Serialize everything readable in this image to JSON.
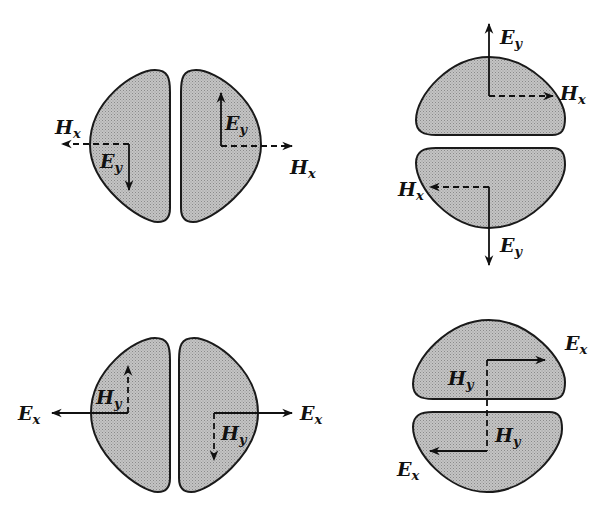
{
  "diagram": {
    "colors": {
      "lobe_fill": "#b8b8b8",
      "stroke": "#1a1a1a",
      "background": "#ffffff"
    },
    "panels": [
      {
        "id": "top-left",
        "orientation": "vertical-split",
        "labels": [
          {
            "main": "H",
            "sub": "x",
            "note": "dashed arrow pointing left"
          },
          {
            "main": "E",
            "sub": "y",
            "note": "solid arrow pointing down (left lobe)"
          },
          {
            "main": "E",
            "sub": "y",
            "note": "solid arrow pointing up (right lobe)"
          },
          {
            "main": "H",
            "sub": "x",
            "note": "dashed arrow pointing right"
          }
        ]
      },
      {
        "id": "top-right",
        "orientation": "horizontal-split",
        "labels": [
          {
            "main": "E",
            "sub": "y",
            "note": "solid arrow pointing up"
          },
          {
            "main": "H",
            "sub": "x",
            "note": "dashed arrow pointing right (upper lobe)"
          },
          {
            "main": "H",
            "sub": "x",
            "note": "dashed arrow pointing left (lower lobe)"
          },
          {
            "main": "E",
            "sub": "y",
            "note": "solid arrow pointing down"
          }
        ]
      },
      {
        "id": "bottom-left",
        "orientation": "vertical-split",
        "labels": [
          {
            "main": "E",
            "sub": "x",
            "note": "solid arrow pointing left"
          },
          {
            "main": "H",
            "sub": "y",
            "note": "dashed arrow pointing up (left lobe)"
          },
          {
            "main": "H",
            "sub": "y",
            "note": "dashed arrow pointing down (right lobe)"
          },
          {
            "main": "E",
            "sub": "x",
            "note": "solid arrow pointing right"
          }
        ]
      },
      {
        "id": "bottom-right",
        "orientation": "horizontal-split",
        "labels": [
          {
            "main": "E",
            "sub": "x",
            "note": "solid arrow pointing right (upper lobe)"
          },
          {
            "main": "H",
            "sub": "y",
            "note": "dashed line, upper lobe"
          },
          {
            "main": "H",
            "sub": "y",
            "note": "dashed line, lower lobe"
          },
          {
            "main": "E",
            "sub": "x",
            "note": "solid arrow pointing left (lower lobe)"
          }
        ]
      }
    ]
  }
}
